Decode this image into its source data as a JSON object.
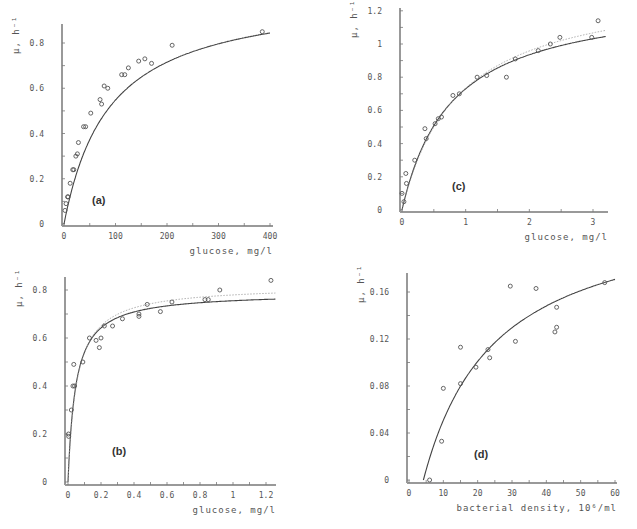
{
  "figure": {
    "background": "#ffffff",
    "axis_color": "#999999",
    "line_color": "#444444",
    "marker_color": "#555555"
  },
  "chart_data": [
    {
      "type": "scatter",
      "panel": "(a)",
      "title": "",
      "xlabel": "glucose, mg/l",
      "ylabel": "μ, h⁻¹",
      "xlim": [
        0,
        400
      ],
      "ylim": [
        0,
        0.9
      ],
      "xticks": [
        0,
        100,
        200,
        300,
        400
      ],
      "xtick_labels": [
        "0",
        "100",
        "200",
        "300",
        "400"
      ],
      "yticks": [
        0,
        0.2,
        0.4,
        0.6,
        0.8
      ],
      "ytick_labels": [
        "0",
        "0.2",
        "0.4",
        "0.6",
        "0.8"
      ],
      "grid": false,
      "frame": {
        "x0": 64,
        "x1": 270,
        "y0": 224,
        "ytop_val": 0.8,
        "ytop_px": 43,
        "axis_x": 62,
        "axis_top": 24,
        "axis_right": 273,
        "xaxis_y": 226
      },
      "label_pos": [
        92,
        204
      ],
      "points": [
        {
          "x": 2,
          "y": 0.06
        },
        {
          "x": 4,
          "y": 0.09
        },
        {
          "x": 7,
          "y": 0.12
        },
        {
          "x": 8,
          "y": 0.12
        },
        {
          "x": 12,
          "y": 0.18
        },
        {
          "x": 17,
          "y": 0.24
        },
        {
          "x": 19,
          "y": 0.24
        },
        {
          "x": 23,
          "y": 0.3
        },
        {
          "x": 26,
          "y": 0.31
        },
        {
          "x": 28,
          "y": 0.36
        },
        {
          "x": 38,
          "y": 0.43
        },
        {
          "x": 42,
          "y": 0.43
        },
        {
          "x": 52,
          "y": 0.49
        },
        {
          "x": 70,
          "y": 0.55
        },
        {
          "x": 73,
          "y": 0.53
        },
        {
          "x": 78,
          "y": 0.61
        },
        {
          "x": 85,
          "y": 0.6
        },
        {
          "x": 112,
          "y": 0.66
        },
        {
          "x": 118,
          "y": 0.66
        },
        {
          "x": 125,
          "y": 0.69
        },
        {
          "x": 145,
          "y": 0.72
        },
        {
          "x": 157,
          "y": 0.73
        },
        {
          "x": 170,
          "y": 0.71
        },
        {
          "x": 210,
          "y": 0.79
        },
        {
          "x": 385,
          "y": 0.85
        }
      ],
      "series": [
        {
          "name": "fit",
          "style": "solid",
          "model": "monod",
          "params": {
            "mu_max": 1.03,
            "K": 88,
            "S0": 0
          }
        }
      ]
    },
    {
      "type": "scatter",
      "panel": "(c)",
      "title": "",
      "xlabel": "glucose, mg/l",
      "ylabel": "μ, h⁻¹",
      "xlim": [
        0,
        3.2
      ],
      "ylim": [
        0,
        1.2
      ],
      "xticks": [
        0,
        1,
        2,
        3
      ],
      "xtick_labels": [
        "0",
        "1",
        "2",
        "3"
      ],
      "yticks": [
        0,
        0.2,
        0.4,
        0.6,
        0.8,
        1,
        1.2
      ],
      "ytick_labels": [
        "0",
        "0.2",
        "0.4",
        "0.6",
        "0.8",
        "1",
        "1.2"
      ],
      "grid": false,
      "frame": {
        "x0": 402,
        "x1": 593,
        "x1_val": 3,
        "y0": 210,
        "ytop_val": 1.0,
        "ytop_px": 44,
        "axis_x": 400,
        "axis_top": 8,
        "axis_right": 608,
        "xaxis_y": 212
      },
      "label_pos": [
        452,
        190
      ],
      "points": [
        {
          "x": 0.0,
          "y": 0.1
        },
        {
          "x": 0.03,
          "y": 0.05
        },
        {
          "x": 0.06,
          "y": 0.22
        },
        {
          "x": 0.07,
          "y": 0.16
        },
        {
          "x": 0.2,
          "y": 0.3
        },
        {
          "x": 0.36,
          "y": 0.49
        },
        {
          "x": 0.38,
          "y": 0.43
        },
        {
          "x": 0.52,
          "y": 0.52
        },
        {
          "x": 0.57,
          "y": 0.55
        },
        {
          "x": 0.62,
          "y": 0.56
        },
        {
          "x": 0.8,
          "y": 0.69
        },
        {
          "x": 0.9,
          "y": 0.7
        },
        {
          "x": 1.18,
          "y": 0.8
        },
        {
          "x": 1.33,
          "y": 0.81
        },
        {
          "x": 1.64,
          "y": 0.8
        },
        {
          "x": 1.78,
          "y": 0.91
        },
        {
          "x": 2.14,
          "y": 0.96
        },
        {
          "x": 2.33,
          "y": 1.0
        },
        {
          "x": 2.48,
          "y": 1.04
        },
        {
          "x": 2.98,
          "y": 1.04
        },
        {
          "x": 3.08,
          "y": 1.14
        }
      ],
      "series": [
        {
          "name": "fit",
          "style": "solid",
          "model": "monod",
          "params": {
            "mu_max": 1.3,
            "K": 0.78,
            "S0": 0
          }
        },
        {
          "name": "fit-dotted",
          "style": "dotted",
          "model": "monod",
          "params": {
            "mu_max": 1.38,
            "K": 0.88,
            "S0": 0
          }
        }
      ]
    },
    {
      "type": "scatter",
      "panel": "(b)",
      "title": "",
      "xlabel": "glucose, mg/l",
      "ylabel": "μ, h⁻¹",
      "xlim": [
        0,
        1.3
      ],
      "ylim": [
        0,
        0.85
      ],
      "xticks": [
        0,
        0.2,
        0.4,
        0.6,
        0.8,
        1,
        1.2
      ],
      "xtick_labels": [
        "0",
        "0.2",
        "0.4",
        "0.6",
        "0.8",
        "1",
        "1.2"
      ],
      "yticks": [
        0,
        0.2,
        0.4,
        0.6,
        0.8
      ],
      "ytick_labels": [
        "0",
        "0.2",
        "0.4",
        "0.6",
        "0.8"
      ],
      "grid": false,
      "frame": {
        "x0": 68,
        "x1": 266,
        "x1_val": 1.2,
        "y0": 482,
        "ytop_val": 0.8,
        "ytop_px": 290,
        "axis_x": 65,
        "axis_top": 277,
        "axis_right": 276,
        "xaxis_y": 485
      },
      "label_pos": [
        112,
        455
      ],
      "points": [
        {
          "x": 0.003,
          "y": 0.2
        },
        {
          "x": 0.004,
          "y": 0.19
        },
        {
          "x": 0.02,
          "y": 0.3
        },
        {
          "x": 0.03,
          "y": 0.4
        },
        {
          "x": 0.04,
          "y": 0.4
        },
        {
          "x": 0.035,
          "y": 0.49
        },
        {
          "x": 0.09,
          "y": 0.5
        },
        {
          "x": 0.13,
          "y": 0.6
        },
        {
          "x": 0.17,
          "y": 0.59
        },
        {
          "x": 0.19,
          "y": 0.56
        },
        {
          "x": 0.2,
          "y": 0.6
        },
        {
          "x": 0.22,
          "y": 0.65
        },
        {
          "x": 0.27,
          "y": 0.65
        },
        {
          "x": 0.33,
          "y": 0.68
        },
        {
          "x": 0.43,
          "y": 0.69
        },
        {
          "x": 0.43,
          "y": 0.7
        },
        {
          "x": 0.48,
          "y": 0.74
        },
        {
          "x": 0.56,
          "y": 0.71
        },
        {
          "x": 0.63,
          "y": 0.75
        },
        {
          "x": 0.83,
          "y": 0.76
        },
        {
          "x": 0.85,
          "y": 0.76
        },
        {
          "x": 0.92,
          "y": 0.8
        },
        {
          "x": 1.23,
          "y": 0.84
        }
      ],
      "series": [
        {
          "name": "fit",
          "style": "solid",
          "model": "monod",
          "params": {
            "mu_max": 0.79,
            "K": 0.046,
            "S0": 0
          }
        },
        {
          "name": "fit-dotted",
          "style": "dotted",
          "model": "monod",
          "params": {
            "mu_max": 0.82,
            "K": 0.052,
            "S0": 0
          }
        }
      ]
    },
    {
      "type": "scatter",
      "panel": "(d)",
      "title": "",
      "xlabel": "bacterial density, 10⁶/ml",
      "ylabel": "μ, h⁻¹",
      "xlim": [
        0,
        60
      ],
      "ylim": [
        0,
        0.17
      ],
      "xticks": [
        0,
        10,
        20,
        30,
        40,
        50,
        60
      ],
      "xtick_labels": [
        "0",
        "10",
        "20",
        "30",
        "40",
        "50",
        "60"
      ],
      "yticks": [
        0,
        0.04,
        0.08,
        0.12,
        0.16
      ],
      "ytick_labels": [
        "0",
        "0.04",
        "0.08",
        "0.12",
        "0.16"
      ],
      "grid": false,
      "frame": {
        "x0": 409,
        "x1": 615,
        "x1_val": 60,
        "y0": 480,
        "ytop_val": 0.16,
        "ytop_px": 292,
        "axis_x": 407,
        "axis_top": 273,
        "axis_right": 617,
        "xaxis_y": 483
      },
      "label_pos": [
        474,
        458
      ],
      "points": [
        {
          "x": 6,
          "y": 0.0
        },
        {
          "x": 9.5,
          "y": 0.033
        },
        {
          "x": 10,
          "y": 0.078
        },
        {
          "x": 15,
          "y": 0.082
        },
        {
          "x": 15,
          "y": 0.113
        },
        {
          "x": 19.5,
          "y": 0.096
        },
        {
          "x": 23,
          "y": 0.111
        },
        {
          "x": 23.5,
          "y": 0.104
        },
        {
          "x": 29.5,
          "y": 0.165
        },
        {
          "x": 31,
          "y": 0.118
        },
        {
          "x": 37,
          "y": 0.163
        },
        {
          "x": 42.5,
          "y": 0.126
        },
        {
          "x": 43,
          "y": 0.13
        },
        {
          "x": 43,
          "y": 0.147
        },
        {
          "x": 57,
          "y": 0.168
        }
      ],
      "series": [
        {
          "name": "fit",
          "style": "solid",
          "model": "monod",
          "params": {
            "mu_max": 0.235,
            "K": 21,
            "S0": 4.2
          }
        }
      ]
    }
  ]
}
